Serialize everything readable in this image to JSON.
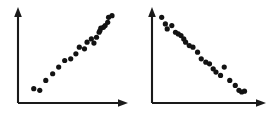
{
  "figure": {
    "title": "",
    "background_color": "#ffffff",
    "axis_color": "#1a1a1a",
    "point_color": "#121212",
    "panel_count": 2
  },
  "chart_data": [
    {
      "type": "scatter",
      "name": "positive-correlation-scatter",
      "title": "",
      "subtitle": "",
      "xlabel": "",
      "ylabel": "",
      "xlim": [
        0,
        100
      ],
      "ylim": [
        0,
        100
      ],
      "grid": false,
      "legend": null,
      "annotations": [],
      "axes": {
        "x_axis": {
          "visible": true,
          "arrow": true,
          "ticks": [],
          "ticklabels": []
        },
        "y_axis": {
          "visible": true,
          "arrow": true,
          "ticks": [],
          "ticklabels": []
        }
      },
      "trend": "increasing",
      "point_count": 22,
      "point_radius_px": 2.6,
      "x": [
        9,
        16,
        23,
        31,
        38,
        45,
        52,
        58,
        62,
        68,
        71,
        76,
        79,
        82,
        85,
        86,
        87,
        90,
        92,
        95,
        96,
        100
      ],
      "y": [
        10,
        8,
        20,
        28,
        36,
        44,
        46,
        52,
        60,
        58,
        66,
        70,
        65,
        72,
        78,
        80,
        83,
        84,
        86,
        90,
        96,
        98
      ]
    },
    {
      "type": "scatter",
      "name": "negative-correlation-scatter",
      "title": "",
      "subtitle": "",
      "xlabel": "",
      "ylabel": "",
      "xlim": [
        0,
        100
      ],
      "ylim": [
        0,
        100
      ],
      "grid": false,
      "legend": null,
      "annotations": [],
      "axes": {
        "x_axis": {
          "visible": true,
          "arrow": true,
          "ticks": [],
          "ticklabels": []
        },
        "y_axis": {
          "visible": true,
          "arrow": true,
          "ticks": [],
          "ticklabels": []
        }
      },
      "trend": "decreasing",
      "point_count": 24,
      "point_radius_px": 2.6,
      "x": [
        4,
        8,
        10,
        15,
        19,
        22,
        25,
        28,
        30,
        34,
        38,
        43,
        47,
        52,
        56,
        60,
        63,
        68,
        72,
        78,
        84,
        88,
        91,
        94
      ],
      "y": [
        96,
        88,
        82,
        86,
        78,
        76,
        74,
        70,
        66,
        62,
        60,
        54,
        46,
        42,
        40,
        34,
        30,
        26,
        36,
        20,
        14,
        8,
        6,
        7
      ]
    }
  ]
}
